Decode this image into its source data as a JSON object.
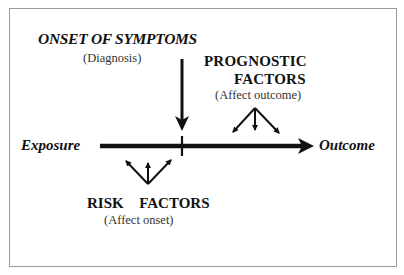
{
  "diagram": {
    "onset": {
      "title": "ONSET OF SYMPTOMS",
      "subtitle": "(Diagnosis)"
    },
    "prognostic": {
      "title_line1": "PROGNOSTIC",
      "title_line2": "FACTORS",
      "subtitle": "(Affect outcome)"
    },
    "timeline": {
      "start_label": "Exposure",
      "end_label": "Outcome"
    },
    "risk": {
      "title": "RISK  FACTORS",
      "subtitle": "(Affect onset)"
    },
    "colors": {
      "ink": "#111111",
      "frame": "#9a9a9a",
      "background": "#ffffff"
    }
  }
}
